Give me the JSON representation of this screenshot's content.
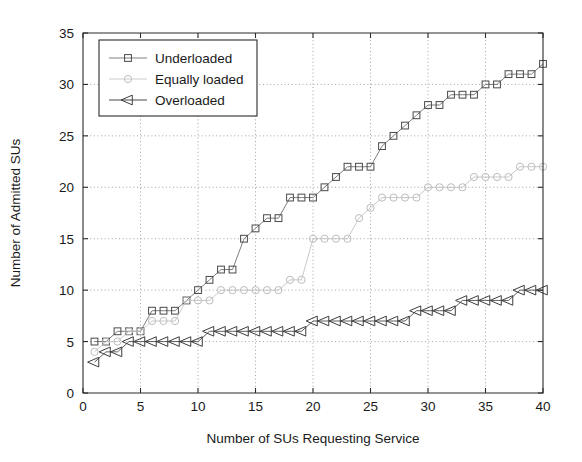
{
  "chart_data": {
    "type": "line",
    "title": "",
    "xlabel": "Number of SUs Requesting Service",
    "ylabel": "Number of Admitted SUs",
    "xlim": [
      0,
      40
    ],
    "ylim": [
      0,
      35
    ],
    "xticks": [
      0,
      5,
      10,
      15,
      20,
      25,
      30,
      35,
      40
    ],
    "yticks": [
      0,
      5,
      10,
      15,
      20,
      25,
      30,
      35
    ],
    "grid": true,
    "legend_position": "upper-left",
    "x": [
      1,
      2,
      3,
      4,
      5,
      6,
      7,
      8,
      9,
      10,
      11,
      12,
      13,
      14,
      15,
      16,
      17,
      18,
      19,
      20,
      21,
      22,
      23,
      24,
      25,
      26,
      27,
      28,
      29,
      30,
      31,
      32,
      33,
      34,
      35,
      36,
      37,
      38,
      39,
      40
    ],
    "series": [
      {
        "name": "Underloaded",
        "marker": "square",
        "color": "#4a4a4a",
        "values": [
          5,
          5,
          6,
          6,
          6,
          8,
          8,
          8,
          9,
          10,
          11,
          12,
          12,
          15,
          16,
          17,
          17,
          19,
          19,
          19,
          20,
          21,
          22,
          22,
          22,
          24,
          25,
          26,
          27,
          28,
          28,
          29,
          29,
          29,
          30,
          30,
          31,
          31,
          31,
          32
        ]
      },
      {
        "name": "Equally loaded",
        "marker": "circle",
        "color": "#bdbdbd",
        "values": [
          4,
          5,
          5,
          6,
          6,
          7,
          7,
          7,
          9,
          9,
          9,
          10,
          10,
          10,
          10,
          10,
          10,
          11,
          11,
          15,
          15,
          15,
          15,
          17,
          18,
          19,
          19,
          19,
          19,
          20,
          20,
          20,
          20,
          21,
          21,
          21,
          21,
          22,
          22,
          22
        ]
      },
      {
        "name": "Overloaded",
        "marker": "triangle-left",
        "color": "#3d3d3d",
        "values": [
          3,
          4,
          4,
          5,
          5,
          5,
          5,
          5,
          5,
          5,
          6,
          6,
          6,
          6,
          6,
          6,
          6,
          6,
          6,
          7,
          7,
          7,
          7,
          7,
          7,
          7,
          7,
          7,
          8,
          8,
          8,
          8,
          9,
          9,
          9,
          9,
          9,
          10,
          10,
          10
        ]
      }
    ]
  },
  "legend": {
    "items": [
      {
        "label": "Underloaded",
        "marker": "square-marker-icon"
      },
      {
        "label": "Equally loaded",
        "marker": "circle-marker-icon"
      },
      {
        "label": "Overloaded",
        "marker": "triangle-left-marker-icon"
      }
    ]
  },
  "axes": {
    "x_title": "Number of SUs Requesting Service",
    "y_title": "Number of Admitted SUs",
    "x_tick_labels": [
      "0",
      "5",
      "10",
      "15",
      "20",
      "25",
      "30",
      "35",
      "40"
    ],
    "y_tick_labels": [
      "0",
      "5",
      "10",
      "15",
      "20",
      "25",
      "30",
      "35"
    ]
  }
}
